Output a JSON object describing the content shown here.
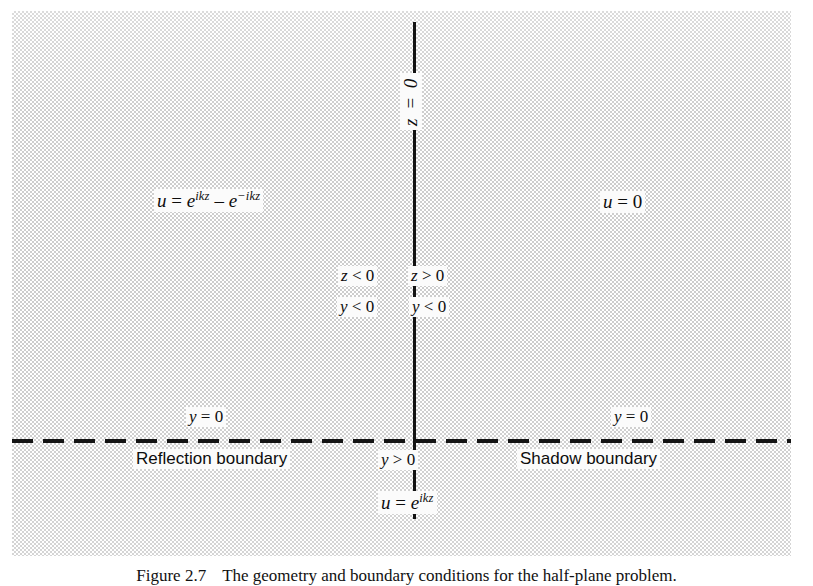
{
  "figure": {
    "caption_label": "Figure 2.7",
    "caption_text": "The geometry and boundary conditions for the half-plane problem."
  },
  "diagram": {
    "axes": {
      "vertical_axis_label": "z = 0",
      "vertical_axis_label_parts": {
        "var": "z",
        "op": "=",
        "value": "0"
      },
      "horizontal_axis_style": "dashed"
    },
    "regions": {
      "upper_left_field": {
        "lhs": "u",
        "op": "=",
        "term1_base": "e",
        "term1_exp": "ikz",
        "minus": "–",
        "term2_base": "e",
        "term2_exp": "−ikz",
        "full": "u = e^{ikz} – e^{−ikz}"
      },
      "upper_right_field": {
        "lhs": "u",
        "op": "=",
        "value": "0",
        "full": "u = 0"
      },
      "lower_field": {
        "lhs": "u",
        "op": "=",
        "term_base": "e",
        "term_exp": "ikz",
        "full": "u = e^{ikz}"
      }
    },
    "inequalities": {
      "z_negative": {
        "var": "z",
        "op": "<",
        "value": "0",
        "full": "z < 0"
      },
      "z_positive": {
        "var": "z",
        "op": ">",
        "value": "0",
        "full": "z > 0"
      },
      "y_negative_left": {
        "var": "y",
        "op": "<",
        "value": "0",
        "full": "y < 0"
      },
      "y_negative_right": {
        "var": "y",
        "op": "<",
        "value": "0",
        "full": "y < 0"
      },
      "y_zero_left": {
        "var": "y",
        "op": "=",
        "value": "0",
        "full": "y = 0"
      },
      "y_zero_right": {
        "var": "y",
        "op": "=",
        "value": "0",
        "full": "y = 0"
      },
      "y_positive": {
        "var": "y",
        "op": ">",
        "value": "0",
        "full": "y > 0"
      }
    },
    "boundaries": {
      "reflection": "Reflection boundary",
      "shadow": "Shadow boundary"
    }
  },
  "colors": {
    "ink": "#0d0d0d",
    "panel_fill": "#c9c9c9",
    "page_background": "#ffffff",
    "label_background": "#fbfbfb"
  }
}
